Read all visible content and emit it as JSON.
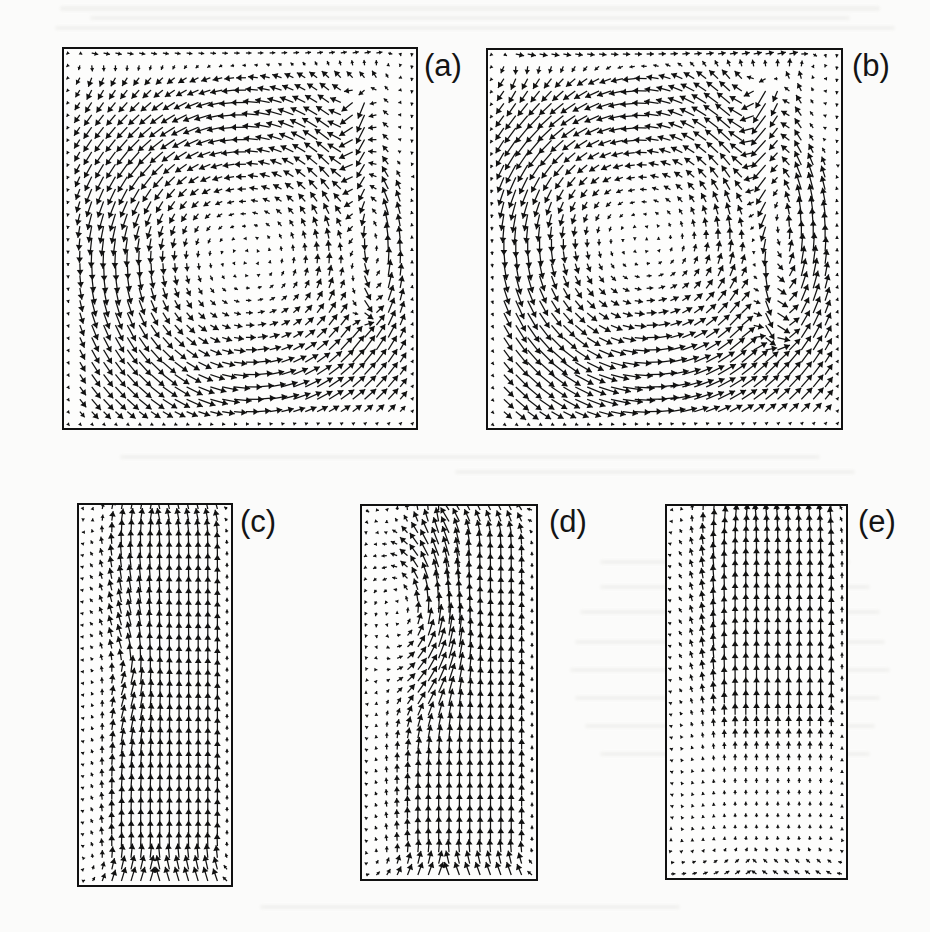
{
  "figure": {
    "kind": "multi-panel-vector-field-figure",
    "panel_count": 5,
    "background_color": "#fbfbfa",
    "ink_color": "#111111",
    "media": "scanned journal page, grayscale halftone"
  },
  "chart_data": {
    "type": "quiver",
    "title": "",
    "subtitle": "",
    "xlabel": "",
    "ylabel": "",
    "grid": false,
    "legend": null,
    "annotations": [],
    "axis_ticks": {
      "x": [],
      "y": []
    },
    "panels": [
      {
        "id": "a",
        "label": "(a)",
        "shape": "square",
        "rect": {
          "x": 62,
          "y": 47,
          "w": 356,
          "h": 383
        },
        "label_pos": {
          "x": 424,
          "y": 50
        },
        "grid": {
          "nx": 30,
          "ny": 31
        },
        "arrow_scale": 1.0,
        "flow": {
          "model": "cavity_vortex",
          "core": {
            "x": 0.52,
            "y": 0.55
          },
          "core_radius": 0.4,
          "rotation": "clockwise",
          "strength": 1.0,
          "jet": {
            "x": 0.855,
            "width": 0.045,
            "strength": 1.55,
            "direction": "down",
            "y0": 0.05,
            "y1": 0.8
          },
          "wall_layer": 0.055,
          "top_drive": 0.45,
          "quiet_corner": {
            "x0": 0.88,
            "y0": 0.0,
            "x1": 1.0,
            "y1": 0.42
          }
        }
      },
      {
        "id": "b",
        "label": "(b)",
        "shape": "square",
        "rect": {
          "x": 486,
          "y": 48,
          "w": 357,
          "h": 382
        },
        "label_pos": {
          "x": 852,
          "y": 50
        },
        "grid": {
          "nx": 30,
          "ny": 31
        },
        "arrow_scale": 1.05,
        "flow": {
          "model": "cavity_vortex",
          "core": {
            "x": 0.44,
            "y": 0.5
          },
          "core_radius": 0.42,
          "rotation": "clockwise",
          "strength": 1.08,
          "jet": {
            "x": 0.8,
            "width": 0.055,
            "strength": 1.7,
            "direction": "down",
            "y0": 0.02,
            "y1": 0.86
          },
          "wall_layer": 0.05,
          "top_drive": 0.55,
          "quiet_corner": {
            "x0": 0.86,
            "y0": 0.0,
            "x1": 1.0,
            "y1": 0.38
          }
        }
      },
      {
        "id": "c",
        "label": "(c)",
        "shape": "tall",
        "rect": {
          "x": 77,
          "y": 503,
          "w": 156,
          "h": 384
        },
        "label_pos": {
          "x": 240,
          "y": 506
        },
        "grid": {
          "nx": 16,
          "ny": 33
        },
        "arrow_scale": 0.95,
        "flow": {
          "model": "channel_up",
          "direction": "up",
          "core_speed": 1.0,
          "profile": "plug",
          "left_shear": 0.3,
          "disturbance": {
            "x": 0.3,
            "y": 0.42,
            "radius": 0.26,
            "strength": 0.32
          },
          "top_turn": 0.4
        }
      },
      {
        "id": "d",
        "label": "(d)",
        "shape": "tall",
        "rect": {
          "x": 360,
          "y": 504,
          "w": 178,
          "h": 377
        },
        "label_pos": {
          "x": 549,
          "y": 506
        },
        "grid": {
          "nx": 17,
          "ny": 33
        },
        "arrow_scale": 0.95,
        "flow": {
          "model": "channel_up_with_eddy",
          "direction": "up",
          "core_speed": 0.85,
          "profile": "plug",
          "left_shear": 0.35,
          "eddy": {
            "x": 0.33,
            "y": 0.27,
            "radius": 0.26,
            "strength": 0.85,
            "rotation": "clockwise"
          },
          "top_turn": 0.55
        }
      },
      {
        "id": "e",
        "label": "(e)",
        "shape": "tall",
        "rect": {
          "x": 665,
          "y": 504,
          "w": 183,
          "h": 376
        },
        "label_pos": {
          "x": 858,
          "y": 506
        },
        "grid": {
          "nx": 17,
          "ny": 33
        },
        "arrow_scale": 1.0,
        "flow": {
          "model": "channel_up_decaying",
          "direction": "up",
          "core_speed": 1.15,
          "profile": "plug",
          "left_shear": 0.42,
          "decay_start": 0.58,
          "decay_rate": 2.2,
          "bottom_weak": 0.18,
          "top_turn": 0.25
        }
      }
    ]
  }
}
